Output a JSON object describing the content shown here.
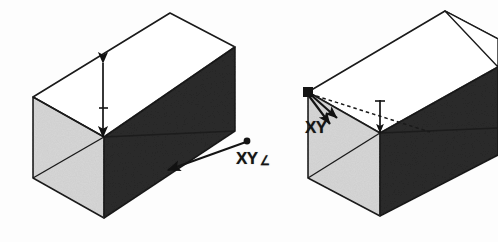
{
  "figure": {
    "background_color": "#fdfdfd",
    "views": [
      {
        "name": "left-view",
        "labels": [
          {
            "id": "left-xy",
            "text": "XY",
            "suffix_glyph": "angle-z-glyph",
            "suffix_text": "∠"
          }
        ],
        "annotations": [
          {
            "name": "height-dimension-arrow",
            "type": "double-headed-arrow",
            "orientation": "vertical"
          },
          {
            "name": "depth-leader-arrow",
            "type": "leader-arrow",
            "orientation": "diagonal"
          }
        ],
        "faces": [
          {
            "name": "top-face",
            "fill": "#ffffff"
          },
          {
            "name": "left-face",
            "fill": "#d6d6d6"
          },
          {
            "name": "front-face",
            "fill": "#2b2b2b"
          }
        ]
      },
      {
        "name": "right-view",
        "labels": [
          {
            "id": "right-xy",
            "text": "XY",
            "suffix_glyph": "",
            "suffix_text": ""
          }
        ],
        "annotations": [
          {
            "name": "origin-vertex-marker",
            "type": "square-node"
          },
          {
            "name": "origin-leader-arrow-upper",
            "type": "leader-arrow",
            "orientation": "diagonal"
          },
          {
            "name": "origin-leader-arrow-lower",
            "type": "leader-arrow",
            "orientation": "diagonal"
          },
          {
            "name": "hidden-edge-dashed",
            "type": "dashed-line",
            "orientation": "diagonal"
          },
          {
            "name": "height-reference-arrow",
            "type": "single-arrow",
            "orientation": "vertical"
          }
        ],
        "faces": [
          {
            "name": "top-face",
            "fill": "#ffffff"
          },
          {
            "name": "left-face",
            "fill": "#d6d6d6"
          },
          {
            "name": "front-face",
            "fill": "#2b2b2b"
          }
        ]
      }
    ],
    "colors": {
      "outline": "#1a1a1a",
      "face_top": "#ffffff",
      "face_left": "#d6d6d6",
      "face_front": "#2b2b2b",
      "label_text": "#151515",
      "background": "#fdfdfd"
    }
  }
}
